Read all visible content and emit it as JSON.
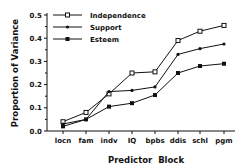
{
  "chart_data": {
    "type": "line",
    "title": "",
    "xlabel": "Predictor  Block",
    "ylabel": "Proportion of Variance",
    "categories": [
      "locn",
      "fam",
      "indv",
      "IQ",
      "bpbs",
      "ddis",
      "schl",
      "pgm"
    ],
    "ylim": [
      0.0,
      0.5
    ],
    "yticks": [
      "0.0",
      "0.1",
      "0.2",
      "0.3",
      "0.4",
      "0.5"
    ],
    "grid": false,
    "legend_position": "upper-left",
    "series": [
      {
        "name": "Independence",
        "marker": "hollow-square",
        "values": [
          0.04,
          0.08,
          0.16,
          0.25,
          0.255,
          0.39,
          0.43,
          0.455
        ]
      },
      {
        "name": "Support",
        "marker": "dot",
        "values": [
          0.03,
          0.05,
          0.17,
          0.175,
          0.19,
          0.33,
          0.355,
          0.375
        ]
      },
      {
        "name": "Esteem",
        "marker": "filled-square",
        "values": [
          0.02,
          0.05,
          0.105,
          0.12,
          0.155,
          0.25,
          0.28,
          0.29
        ]
      }
    ]
  }
}
